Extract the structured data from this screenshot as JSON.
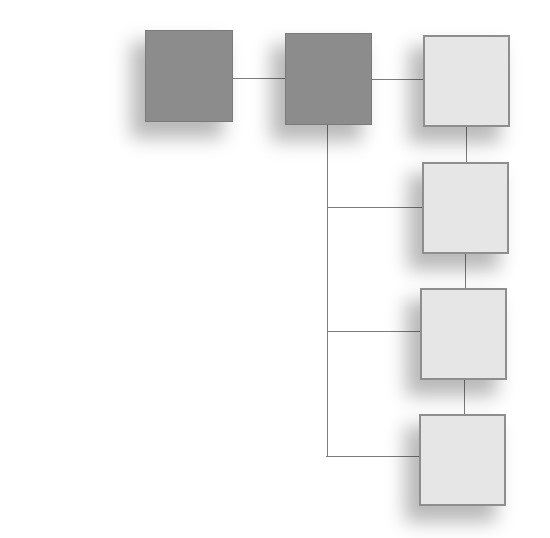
{
  "diagram": {
    "type": "hierarchy",
    "colors": {
      "dark_node": "#8c8c8c",
      "light_node": "#e6e6e6",
      "connector": "#7d7d7d",
      "background": "#ffffff"
    },
    "nodes": [
      {
        "id": "n1",
        "style": "dark",
        "x": 145,
        "y": 30,
        "w": 88,
        "h": 92
      },
      {
        "id": "n2",
        "style": "dark",
        "x": 285,
        "y": 33,
        "w": 87,
        "h": 92
      },
      {
        "id": "n3",
        "style": "light",
        "x": 423,
        "y": 35,
        "w": 87,
        "h": 92
      },
      {
        "id": "n4",
        "style": "light",
        "x": 422,
        "y": 162,
        "w": 87,
        "h": 92
      },
      {
        "id": "n5",
        "style": "light",
        "x": 420,
        "y": 288,
        "w": 87,
        "h": 92
      },
      {
        "id": "n6",
        "style": "light",
        "x": 419,
        "y": 414,
        "w": 87,
        "h": 92
      }
    ],
    "edges": [
      {
        "from": "n1",
        "to": "n2"
      },
      {
        "from": "n2",
        "to": "n3"
      },
      {
        "from": "n3",
        "to": "n4"
      },
      {
        "from": "n4",
        "to": "n5"
      },
      {
        "from": "n5",
        "to": "n6"
      },
      {
        "from": "n2",
        "to": "n4",
        "via": "trunk"
      },
      {
        "from": "n2",
        "to": "n5",
        "via": "trunk"
      },
      {
        "from": "n2",
        "to": "n6",
        "via": "trunk"
      }
    ],
    "labels": []
  }
}
